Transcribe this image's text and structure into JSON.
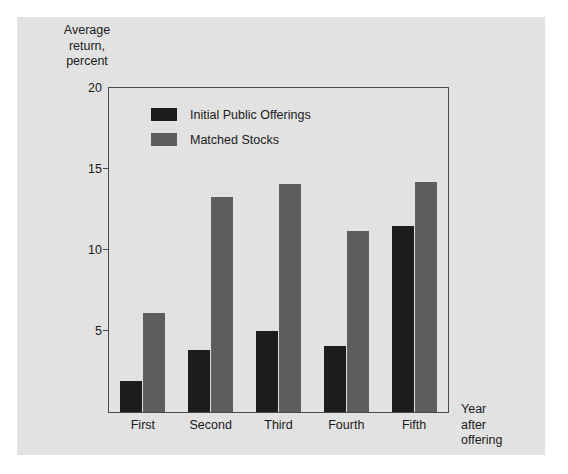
{
  "chart_data": {
    "type": "bar",
    "title": "",
    "ylabel": "Average\nreturn,\npercent",
    "xlabel": "Year\nafter\noffering",
    "categories": [
      "First",
      "Second",
      "Third",
      "Fourth",
      "Fifth"
    ],
    "series": [
      {
        "name": "Initial Public Offerings",
        "color": "#1c1c1c",
        "values": [
          1.9,
          3.8,
          5.0,
          4.1,
          11.5
        ]
      },
      {
        "name": "Matched Stocks",
        "color": "#5e5e5e",
        "values": [
          6.1,
          13.3,
          14.1,
          11.2,
          14.2
        ]
      }
    ],
    "ylim": [
      0,
      20
    ],
    "yticks": [
      20,
      15,
      10,
      5
    ],
    "ytick_labels": [
      "20",
      "15",
      "10",
      "5"
    ],
    "grid": false,
    "legend_position": "top-left-inside"
  },
  "legend": {
    "items": [
      {
        "label": "Initial Public Offerings",
        "swatch": "ipo"
      },
      {
        "label": "Matched Stocks",
        "swatch": "match"
      }
    ]
  },
  "colors": {
    "figure_background": "#e2e2e2",
    "page_background": "#ffffff",
    "axis": "#4a4a4a",
    "text": "#1a1a1a",
    "ipo_bar": "#1c1c1c",
    "matched_bar": "#5e5e5e"
  }
}
